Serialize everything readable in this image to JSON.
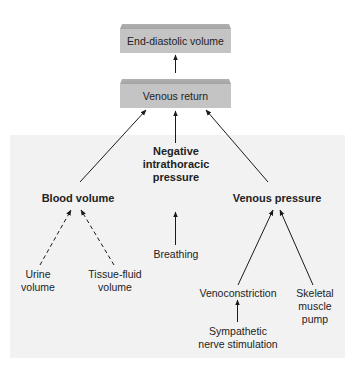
{
  "diagram": {
    "boxes": {
      "end_diastolic_volume": "End-diastolic volume",
      "venous_return": "Venous return"
    },
    "factors": {
      "blood_volume": "Blood volume",
      "negative_intrathoracic_pressure": [
        "Negative",
        "intrathoracic",
        "pressure"
      ],
      "venous_pressure": "Venous pressure"
    },
    "inputs": {
      "urine_volume": [
        "Urine",
        "volume"
      ],
      "tissue_fluid_volume": [
        "Tissue-fluid",
        "volume"
      ],
      "breathing": "Breathing",
      "venoconstriction": "Venoconstriction",
      "skeletal_muscle_pump": [
        "Skeletal",
        "muscle",
        "pump"
      ],
      "sympathetic_nerve_stimulation": [
        "Sympathetic",
        "nerve stimulation"
      ]
    },
    "edges": [
      {
        "from": "Venous return",
        "to": "End-diastolic volume",
        "style": "solid"
      },
      {
        "from": "Blood volume",
        "to": "Venous return",
        "style": "solid"
      },
      {
        "from": "Negative intrathoracic pressure",
        "to": "Venous return",
        "style": "solid"
      },
      {
        "from": "Venous pressure",
        "to": "Venous return",
        "style": "solid"
      },
      {
        "from": "Breathing",
        "to": "Negative intrathoracic pressure",
        "style": "solid"
      },
      {
        "from": "Urine volume",
        "to": "Blood volume",
        "style": "dashed"
      },
      {
        "from": "Tissue-fluid volume",
        "to": "Blood volume",
        "style": "dashed"
      },
      {
        "from": "Venoconstriction",
        "to": "Venous pressure",
        "style": "solid"
      },
      {
        "from": "Skeletal muscle pump",
        "to": "Venous pressure",
        "style": "solid"
      },
      {
        "from": "Sympathetic nerve stimulation",
        "to": "Venoconstriction",
        "style": "solid"
      }
    ],
    "colors": {
      "box_fill": "#c4c4c4",
      "panel_fill": "#f2f2f2",
      "line": "#1a1a1a"
    }
  }
}
